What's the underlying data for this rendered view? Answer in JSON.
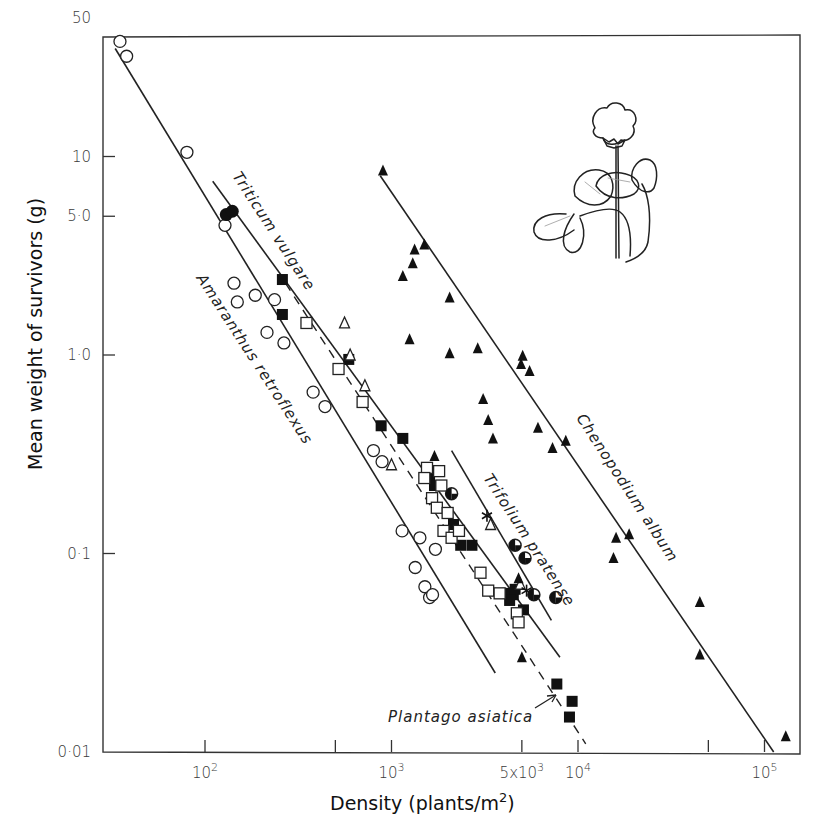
{
  "chart_data": {
    "type": "scatter",
    "title": "",
    "xlabel": "Density (plants/m²)",
    "ylabel": "Mean weight of survivors (g)",
    "xscale": "log",
    "yscale": "log",
    "xlim": [
      30,
      170000
    ],
    "ylim": [
      0.01,
      50
    ],
    "grid": false,
    "legend": "none (species labelled directly along fitted lines)",
    "x_ticks": [
      {
        "value": 100,
        "label": "10²"
      },
      {
        "value": 500,
        "label": ""
      },
      {
        "value": 1000,
        "label": "10³"
      },
      {
        "value": 5000,
        "label": "5x10³"
      },
      {
        "value": 10000,
        "label": "10⁴"
      },
      {
        "value": 50000,
        "label": ""
      },
      {
        "value": 100000,
        "label": "10⁵"
      }
    ],
    "y_ticks": [
      {
        "value": 50,
        "label": "50"
      },
      {
        "value": 10,
        "label": "10"
      },
      {
        "value": 5,
        "label": "5·0"
      },
      {
        "value": 1,
        "label": "1·0"
      },
      {
        "value": 0.1,
        "label": "0·1"
      },
      {
        "value": 0.01,
        "label": "0·01"
      }
    ],
    "lines": [
      {
        "name": "Amaranthus retroflexus",
        "style": "solid",
        "from": [
          33,
          35
        ],
        "to": [
          3600,
          0.025
        ]
      },
      {
        "name": "Triticum vulgare",
        "style": "solid",
        "from": [
          110,
          7.5
        ],
        "to": [
          8000,
          0.03
        ]
      },
      {
        "name": "Plantago asiatica",
        "style": "dashed",
        "from": [
          270,
          2.3
        ],
        "to": [
          11000,
          0.011
        ]
      },
      {
        "name": "Trifolium pratense",
        "style": "solid",
        "from": [
          2100,
          0.33
        ],
        "to": [
          7200,
          0.046
        ]
      },
      {
        "name": "Chenopodium album",
        "style": "solid",
        "from": [
          870,
          8.0
        ],
        "to": [
          112000,
          0.01
        ]
      }
    ],
    "series": [
      {
        "name": "Amaranthus retroflexus",
        "marker": "open-circle",
        "points": [
          [
            35,
            38
          ],
          [
            38,
            32
          ],
          [
            80,
            10.5
          ],
          [
            128,
            4.5
          ],
          [
            143,
            2.3
          ],
          [
            149,
            1.85
          ],
          [
            186,
            2.0
          ],
          [
            215,
            1.3
          ],
          [
            236,
            1.9
          ],
          [
            265,
            1.15
          ],
          [
            380,
            0.65
          ],
          [
            440,
            0.55
          ],
          [
            800,
            0.33
          ],
          [
            890,
            0.29
          ],
          [
            1140,
            0.13
          ],
          [
            1340,
            0.085
          ],
          [
            1420,
            0.12
          ],
          [
            1510,
            0.068
          ],
          [
            1600,
            0.06
          ],
          [
            1660,
            0.062
          ],
          [
            1720,
            0.105
          ]
        ]
      },
      {
        "name": "Triticum vulgare",
        "marker": "filled-circle",
        "points": [
          [
            130,
            5.1
          ],
          [
            140,
            5.3
          ]
        ]
      },
      {
        "name": "Plantago asiatica (filled squares)",
        "marker": "filled-square",
        "points": [
          [
            260,
            2.4
          ],
          [
            260,
            1.6
          ],
          [
            590,
            0.95
          ],
          [
            880,
            0.44
          ],
          [
            1150,
            0.38
          ],
          [
            1600,
            0.24
          ],
          [
            1700,
            0.22
          ],
          [
            2150,
            0.14
          ],
          [
            2350,
            0.11
          ],
          [
            2700,
            0.11
          ],
          [
            4200,
            0.063
          ],
          [
            4500,
            0.062
          ],
          [
            4600,
            0.066
          ],
          [
            4300,
            0.058
          ],
          [
            5100,
            0.052
          ],
          [
            7700,
            0.022
          ],
          [
            9300,
            0.018
          ],
          [
            9000,
            0.015
          ]
        ]
      },
      {
        "name": "Plantago asiatica (open squares)",
        "marker": "open-square",
        "points": [
          [
            350,
            1.45
          ],
          [
            520,
            0.85
          ],
          [
            700,
            0.58
          ],
          [
            1550,
            0.27
          ],
          [
            1800,
            0.26
          ],
          [
            1850,
            0.22
          ],
          [
            1500,
            0.24
          ],
          [
            1650,
            0.19
          ],
          [
            1750,
            0.17
          ],
          [
            2000,
            0.16
          ],
          [
            1900,
            0.13
          ],
          [
            2100,
            0.12
          ],
          [
            2300,
            0.13
          ],
          [
            3000,
            0.08
          ],
          [
            3300,
            0.065
          ],
          [
            3800,
            0.063
          ],
          [
            4700,
            0.05
          ],
          [
            4800,
            0.045
          ]
        ]
      },
      {
        "name": "open triangles",
        "marker": "open-triangle",
        "points": [
          [
            560,
            1.45
          ],
          [
            600,
            1.0
          ],
          [
            720,
            0.7
          ],
          [
            1000,
            0.28
          ],
          [
            3400,
            0.14
          ],
          [
            4900,
            0.07
          ]
        ]
      },
      {
        "name": "Chenopodium album",
        "marker": "filled-triangle",
        "points": [
          [
            900,
            8.5
          ],
          [
            1150,
            2.5
          ],
          [
            1300,
            2.9
          ],
          [
            1330,
            3.4
          ],
          [
            1500,
            3.6
          ],
          [
            2050,
            1.95
          ],
          [
            1250,
            1.2
          ],
          [
            2050,
            1.02
          ],
          [
            2900,
            1.08
          ],
          [
            3100,
            0.6
          ],
          [
            3300,
            0.47
          ],
          [
            3500,
            0.38
          ],
          [
            4950,
            0.9
          ],
          [
            5050,
            0.99
          ],
          [
            5500,
            0.83
          ],
          [
            6100,
            0.43
          ],
          [
            7300,
            0.34
          ],
          [
            8600,
            0.37
          ],
          [
            15500,
            0.095
          ],
          [
            16000,
            0.12
          ],
          [
            18800,
            0.125
          ],
          [
            45000,
            0.057
          ],
          [
            45000,
            0.031
          ],
          [
            130000,
            0.012
          ],
          [
            1700,
            0.31
          ],
          [
            4800,
            0.075
          ],
          [
            5000,
            0.03
          ]
        ]
      },
      {
        "name": "Trifolium pratense",
        "marker": "half-filled-circle",
        "points": [
          [
            2100,
            0.2
          ],
          [
            4600,
            0.11
          ],
          [
            5200,
            0.095
          ],
          [
            5800,
            0.062
          ],
          [
            7600,
            0.06
          ]
        ]
      },
      {
        "name": "asterisk points",
        "marker": "asterisk",
        "points": [
          [
            3250,
            0.155
          ],
          [
            5300,
            0.065
          ]
        ]
      }
    ],
    "annotations": [
      {
        "text": "Triticum vulgare",
        "rotated": true
      },
      {
        "text": "Amaranthus retroflexus",
        "rotated": true
      },
      {
        "text": "Trifolium pratense",
        "rotated": true
      },
      {
        "text": "Chenopodium album",
        "rotated": true
      },
      {
        "text": "Plantago asiatica",
        "arrow_to": [
          9000,
          0.019
        ]
      }
    ],
    "inset_illustration": "line drawing of a clover plant (Trifolium) with flower head and trifoliate leaves"
  },
  "labels": {
    "x_axis_title": "Density (plants/m",
    "x_axis_title_sup": "2",
    "x_axis_title_close": ")",
    "y_axis_title": "Mean weight of survivors (g)",
    "species": {
      "triticum": "Triticum  vulgare",
      "amaranthus": "Amaranthus  retroflexus",
      "trifolium": "Trifolium  pratense",
      "chenopodium": "Chenopodium  album",
      "plantago": "Plantago  asiatica"
    }
  },
  "layout": {
    "plot": {
      "left": 103,
      "right": 800,
      "top": 37,
      "bottom": 752
    },
    "x_decade_px": 186.5,
    "x_ref_value": 100,
    "x_ref_px": 205,
    "y_decade_px": 198.5,
    "y_ref_value": 0.01,
    "y_ref_px": 752
  }
}
